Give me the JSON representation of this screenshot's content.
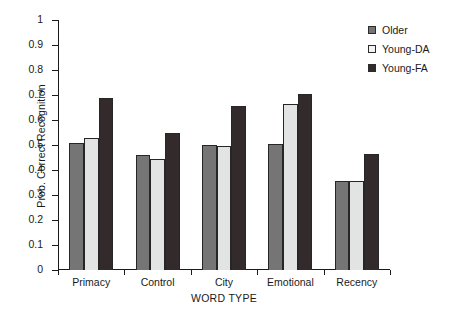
{
  "chart_data": {
    "type": "bar",
    "title": "",
    "xlabel": "WORD TYPE",
    "ylabel": "Prob. Correct Recognition",
    "categories": [
      "Primacy",
      "Control",
      "City",
      "Emotional",
      "Recency"
    ],
    "series": [
      {
        "name": "Older",
        "color": "#757575",
        "values": [
          0.51,
          0.46,
          0.5,
          0.505,
          0.355
        ]
      },
      {
        "name": "Young-DA",
        "color": "#e2e4e3",
        "values": [
          0.53,
          0.445,
          0.495,
          0.665,
          0.355
        ]
      },
      {
        "name": "Young-FA",
        "color": "#332b2b",
        "values": [
          0.69,
          0.55,
          0.655,
          0.705,
          0.465
        ]
      }
    ],
    "ylim": [
      0,
      1
    ],
    "ytick_labels": [
      "0",
      "0.1",
      "0.2",
      "0.3",
      "0.4",
      "0.5",
      "0.6",
      "0.7",
      "0.8",
      "0.9",
      "1"
    ],
    "ytick_values": [
      0,
      0.1,
      0.2,
      0.3,
      0.4,
      0.5,
      0.6,
      0.7,
      0.8,
      0.9,
      1
    ],
    "grid": false,
    "legend_position": "top-right",
    "legend_entries": [
      "Older",
      "Young-DA",
      "Young-FA"
    ]
  },
  "axes": {
    "y_title": "Prob. Correct Recognition",
    "x_title": "WORD TYPE"
  }
}
